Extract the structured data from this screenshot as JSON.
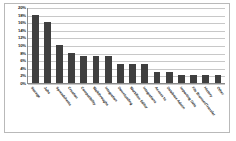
{
  "chart_data": {
    "type": "bar",
    "title": "",
    "subtitle": "",
    "xlabel": "",
    "ylabel": "",
    "ylim": [
      0,
      20
    ],
    "ytick_labels": [
      "20%",
      "18%",
      "16%",
      "14%",
      "12%",
      "10%",
      "8%",
      "6%",
      "4%",
      "2%",
      "0%"
    ],
    "ytick_values": [
      20,
      18,
      16,
      14,
      12,
      10,
      8,
      6,
      4,
      2,
      0
    ],
    "grid": true,
    "legend": "none",
    "bar_color": "#3f3f3f",
    "categories": [
      "Storage",
      "Jobs",
      "Spreadsheets",
      "Creation",
      "Compatibility",
      "Walkthroughs",
      "Integration",
      "Downloading",
      "Workflow Editor",
      "Integrations",
      "Access to",
      "Database Admin",
      "Importing Data",
      "File Browser/Transfer",
      "History",
      "Other"
    ],
    "values": [
      18,
      16,
      10,
      8,
      7,
      7,
      7,
      5,
      5,
      5,
      3,
      3,
      2,
      2,
      2,
      2
    ]
  }
}
